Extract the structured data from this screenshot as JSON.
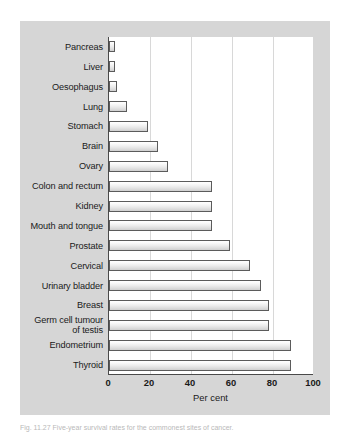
{
  "figure": {
    "caption": "Fig. 11.27  Five-year survival rates for the commonest sites of cancer.",
    "panel_color": "#d6d6d6",
    "plot_background": "#ffffff",
    "bar_outline_color": "#5b5b5b",
    "gridline_color": "#d8d8d8",
    "axis_color": "#4a4a4a"
  },
  "chart_data": {
    "type": "bar",
    "orientation": "horizontal",
    "title": "",
    "xlabel": "Per cent",
    "ylabel": "",
    "xlim": [
      0,
      100
    ],
    "xticks": [
      0,
      20,
      40,
      60,
      80,
      100
    ],
    "xtick_labels": [
      "0",
      "20",
      "40",
      "60",
      "80",
      "100"
    ],
    "grid": true,
    "grid_axis": "x",
    "legend": false,
    "categories": [
      "Pancreas",
      "Liver",
      "Oesophagus",
      "Lung",
      "Stomach",
      "Brain",
      "Ovary",
      "Colon and rectum",
      "Kidney",
      "Mouth and tongue",
      "Prostate",
      "Cervical",
      "Urinary bladder",
      "Breast",
      "Germ cell tumour\nof testis",
      "Endometrium",
      "Thyroid"
    ],
    "values": [
      3,
      3,
      4,
      9,
      19,
      24,
      29,
      50,
      50,
      50,
      59,
      69,
      74,
      78,
      78,
      89,
      89
    ]
  }
}
